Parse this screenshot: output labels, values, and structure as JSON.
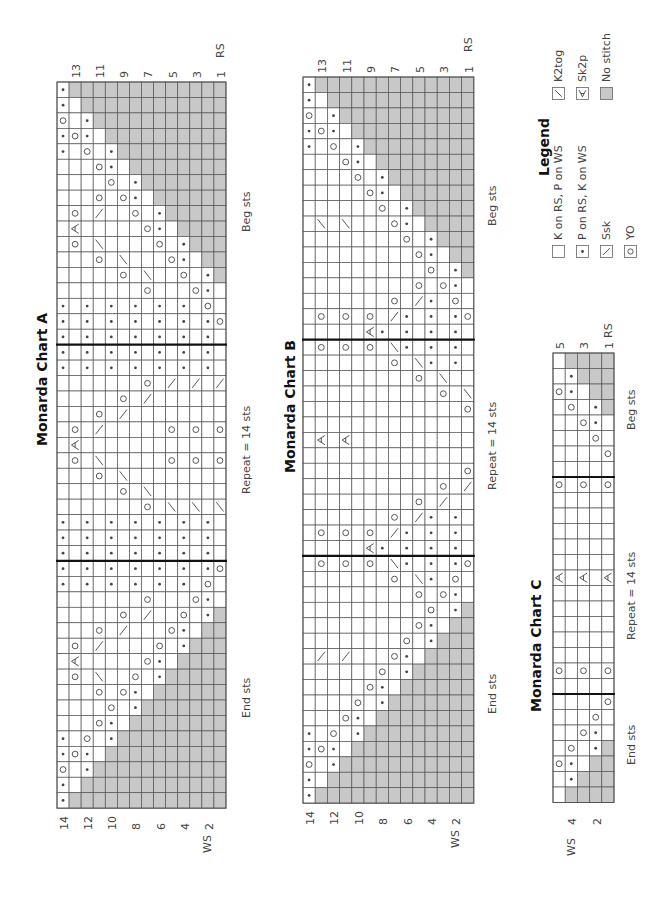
{
  "charts": [
    {
      "id": "A",
      "title": "Monarda Chart A",
      "x": 57,
      "y": 82,
      "cw": 12.07,
      "ch": 15.45,
      "thick_after_rows": [
        17,
        31
      ],
      "labels": {
        "beg": "Beg sts",
        "repeat": "Repeat = 14 sts",
        "end": "End sts",
        "rs": "RS",
        "ws": "WS"
      },
      "rs_rows": [
        "13",
        "11",
        "9",
        "7",
        "5",
        "3",
        "1"
      ],
      "ws_rows": [
        "14",
        "12",
        "10",
        "8",
        "6",
        "4",
        "2"
      ],
      "grid": [
        "P#############",
        "P-############",
        "O-P###########",
        "POP-##########",
        "P-O-P#########",
        "---OP-########",
        "----O-P#######",
        "---O-OP-######",
        "-O-S--O-P#####",
        "-X-----OP-####",
        "-O-K----O-P###",
        "---O-K---OP-##",
        "-----O-K--O-P#",
        "-------O---OP-",
        "P-P-P-P-P-P-O-",
        "P-P-P-P-P-P-PO",
        "P-P-P-P-P-P-P-",
        "P-P-P-P-P-P-P-",
        "P-P-P-P-P-P-P-",
        "-------O-S-S-S",
        "-----O-S------",
        "---O-S--------",
        "-O-S-----O-O-O",
        "-X------------",
        "-O-K-----O-O-O",
        "---O-K--------",
        "-----O-K------",
        "-------O-K-K-K",
        "P-P-P-P-P-P-P-",
        "P-P-P-P-P-P-P-",
        "P-P-P-P-P-P-P-",
        "P-P-P-P-P-P-PO",
        "P-P-P-P-P-P-O-",
        "-------O---OP-",
        "-----O-S--O-P#",
        "---O-S---OP-##",
        "-O-S----O-P###",
        "-X-----OP-####",
        "-O-K--O-P#####",
        "---O-OP-######",
        "----O-P#######",
        "---OP-########",
        "P-O-P#########",
        "POP-##########",
        "O-P###########",
        "P-############",
        "P#############"
      ]
    },
    {
      "id": "B",
      "title": "Monarda Chart B",
      "x": 303,
      "y": 77,
      "cw": 12.2,
      "ch": 15.45,
      "thick_after_rows": [
        17,
        31
      ],
      "labels": {
        "beg": "Beg sts",
        "repeat": "Repeat = 14 sts",
        "end": "End sts",
        "rs": "RS",
        "ws": "WS"
      },
      "rs_rows": [
        "13",
        "11",
        "9",
        "7",
        "5",
        "3",
        "1"
      ],
      "ws_rows": [
        "14",
        "12",
        "10",
        "8",
        "6",
        "4",
        "2"
      ],
      "grid": [
        "P#############",
        "P-############",
        "O-P###########",
        "POP-##########",
        "P-O-P#########",
        "---OP-########",
        "----O-P#######",
        "-----OP-######",
        "------O-P#####",
        "-K-K---OP-####",
        "--------O-P###",
        "---------OP-##",
        "----------O-P#",
        "---------O-OP-",
        "-------O-SP-O-",
        "-O-O-O-SP-P-PO",
        "-----XP-P-P-P-",
        "-O-O-O-KP-P-P-",
        "-------O-KP-P-",
        "---------O-K--",
        "-----------O-K",
        "-------------O",
        "--------------",
        "-X-X----------",
        "--------------",
        "-------------O",
        "-----------O-S",
        "---------O-S--",
        "-------O-SP-P-",
        "-O-O-O-SP-P-P-",
        "-----XP-P-P-P-",
        "-O-O-O-KP-P-PO",
        "-------O-KP-O-",
        "---------O-OP-",
        "----------O-P#",
        "---------OP-##",
        "--------O-P###",
        "-S-S---OP-####",
        "------O-P#####",
        "-----OP-######",
        "----O-P#######",
        "---OP-########",
        "P-O-P#########",
        "POP-##########",
        "O-P###########",
        "P-############",
        "P#############"
      ]
    },
    {
      "id": "C",
      "title": "Monarda Chart C",
      "x": 553,
      "y": 353,
      "cw": 12.2,
      "ch": 15.5,
      "thick_after_rows": [
        8,
        22
      ],
      "labels": {
        "beg": "Beg sts",
        "repeat": "Repeat = 14 sts",
        "end": "End sts",
        "rs": "RS",
        "ws": "WS"
      },
      "rs_rows": [
        "5",
        "3",
        "1"
      ],
      "ws_rows": [
        "4",
        "2"
      ],
      "grid": [
        "-####",
        "-P###",
        "OP-##",
        "-O-P#",
        "--OP-",
        "---O-",
        "----O",
        "-----",
        "O-O-O",
        "-----",
        "-----",
        "-----",
        "-----",
        "-----",
        "X-X-X",
        "-----",
        "-----",
        "-----",
        "-----",
        "-----",
        "O-O-O",
        "-----",
        "----O",
        "---O-",
        "--OP-",
        "-O-P#",
        "OP-##",
        "-P###",
        "-####"
      ]
    }
  ],
  "legend": {
    "title": "Legend",
    "items": [
      {
        "code": "-",
        "label": "K on RS, P on WS",
        "icon": "knit-square-icon"
      },
      {
        "code": "P",
        "label": "P on RS, K on WS",
        "icon": "purl-dot-icon"
      },
      {
        "code": "S",
        "label": "Ssk",
        "icon": "ssk-slash-icon"
      },
      {
        "code": "O",
        "label": "YO",
        "icon": "yarn-over-circle-icon"
      },
      {
        "code": "K",
        "label": "K2tog",
        "icon": "k2tog-slash-icon"
      },
      {
        "code": "X",
        "label": "Sk2p",
        "icon": "sk2p-icon"
      },
      {
        "code": "#",
        "label": "No stitch",
        "icon": "no-stitch-square-icon"
      }
    ]
  },
  "colors": {
    "grid_line": "#555555",
    "no_stitch": "#c8c8c8",
    "symbol": "#444444",
    "thick_line": "#111111"
  }
}
